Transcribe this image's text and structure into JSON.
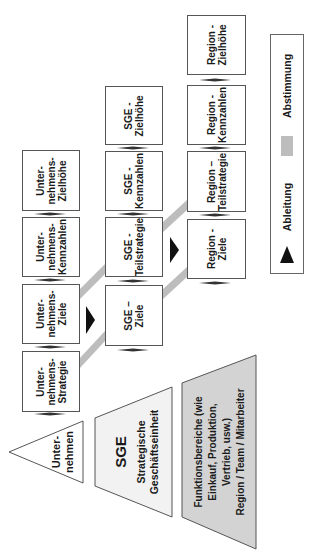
{
  "colors": {
    "box_border": "#555555",
    "band_gray": "#bdbdbd",
    "arrow_black": "#111111",
    "pyramid_light": "#f2f2f2",
    "pyramid_gray": "#d3d3d3"
  },
  "levels": {
    "unternehmen": {
      "pyramid_label": "Unter-\nnehmen",
      "boxes": [
        {
          "label": "Unter-\nnehmens-\nStrategie"
        },
        {
          "label": "Unter-\nnehmens-\nZiele"
        },
        {
          "label": "Unter-\nnehmens-\nKennzahlen"
        },
        {
          "label": "Unter-\nnehmens-\nZielhöhe"
        }
      ]
    },
    "sge": {
      "pyramid_title": "SGE",
      "pyramid_subtitle": "Strategische\nGeschäftseinheit",
      "boxes": [
        {
          "label": "SGE –\nZiele"
        },
        {
          "label": "SGE -\nTeilstrategie"
        },
        {
          "label": "SGE -\nKennzahlen"
        },
        {
          "label": "SGE -\nZielhöhe"
        }
      ]
    },
    "region": {
      "pyramid_label": "Funktionsbereiche (wie\nEinkauf, Produktion,\nVertrieb, usw.)\nRegion / Team / Mitarbeiter",
      "boxes": [
        {
          "label": "Region -\nZiele"
        },
        {
          "label": "Region –\nTeilstrategie"
        },
        {
          "label": "Region -\nKennzahlen"
        },
        {
          "label": "Region -\nZielhöhe"
        }
      ]
    }
  },
  "legend": {
    "derivation_label": "Ableitung",
    "derivation_icon": "black-triangle-arrow",
    "alignment_label": "Abstimmung",
    "alignment_icon": "gray-band-swatch"
  }
}
